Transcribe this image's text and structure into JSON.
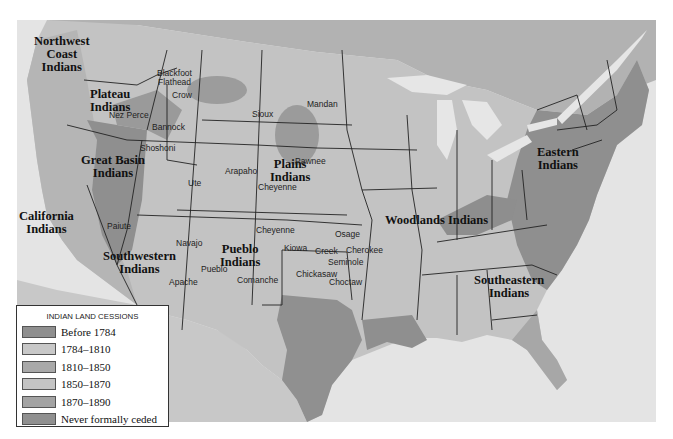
{
  "map": {
    "title": "Indian Land Cessions in the United States",
    "colors": {
      "water": "#e4e4e4",
      "canada": "#b0b0b0",
      "mexico": "#c4c4c4",
      "before_1784": "#8c8c8c",
      "1784_1810": "#c9c9c9",
      "1810_1850": "#a6a6a6",
      "1850_1870": "#c2c2c2",
      "1870_1890": "#9e9e9e",
      "never_ceded": "#8a8a8a",
      "border": "#222222"
    },
    "region_labels": [
      {
        "id": "northwest-coast",
        "text": "Northwest\nCoast\nIndians"
      },
      {
        "id": "plateau",
        "text": "Plateau\nIndians"
      },
      {
        "id": "great-basin",
        "text": "Great Basin\nIndians"
      },
      {
        "id": "california",
        "text": "California\nIndians"
      },
      {
        "id": "southwestern",
        "text": "Southwestern\nIndians"
      },
      {
        "id": "pueblo",
        "text": "Pueblo\nIndians"
      },
      {
        "id": "plains",
        "text": "Plains\nIndians"
      },
      {
        "id": "woodlands",
        "text": "Woodlands Indians"
      },
      {
        "id": "eastern",
        "text": "Eastern\nIndians"
      },
      {
        "id": "southeastern",
        "text": "Southeastern\nIndians"
      }
    ],
    "tribe_labels": [
      "Blackfoot",
      "Flathead",
      "Crow",
      "Nez Perce",
      "Bannock",
      "Shoshoni",
      "Sioux",
      "Mandan",
      "Pawnee",
      "Arapaho",
      "Cheyenne",
      "Ute",
      "Paiute",
      "Cheyenne",
      "Navajo",
      "Pueblo",
      "Apache",
      "Comanche",
      "Kiowa",
      "Osage",
      "Creek",
      "Cherokee",
      "Seminole",
      "Chickasaw",
      "Choctaw"
    ]
  },
  "legend": {
    "title": "INDIAN LAND CESSIONS",
    "items": [
      {
        "label": "Before 1784",
        "color": "#8f8f8f"
      },
      {
        "label": "1784–1810",
        "color": "#c8c8c8"
      },
      {
        "label": "1810–1850",
        "color": "#a9a9a9"
      },
      {
        "label": "1850–1870",
        "color": "#c4c4c4"
      },
      {
        "label": "1870–1890",
        "color": "#a3a3a3"
      },
      {
        "label": "Never formally ceded",
        "color": "#909090"
      }
    ]
  }
}
